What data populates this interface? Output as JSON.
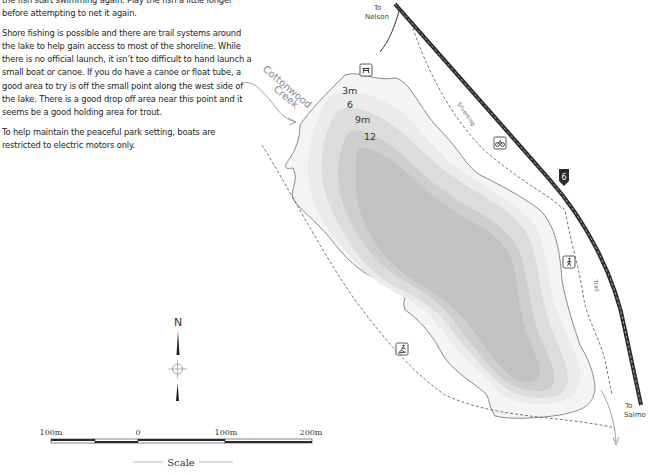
{
  "article": {
    "paragraphs": [
      "the fish start swimming again. Play the fish a little longer before attempting to net it again.",
      "Shore fishing is possible and there are trail systems around the lake to help gain access to most of the shoreline. While there is no official launch, it isn’t too difficult to hand launch a small boat or canoe. If you do have a canoe or float tube, a good area to try is off the small point along the west side of the lake. There is a good drop off area near this point and it seems be a good holding area for trout.",
      "To help maintain the peaceful park setting, boats are restricted to electric motors only."
    ]
  },
  "map": {
    "labels": {
      "to_nelson_1": "To",
      "to_nelson_2": "Nelson",
      "to_salmo_1": "To",
      "to_salmo_2": "Salmo",
      "creek_1": "Cottonwood",
      "creek_2": "Creek",
      "silverking": "Silverking",
      "trail": "Trail",
      "highway_number": "6"
    },
    "depth_labels": [
      "3m",
      "6",
      "9m",
      "12"
    ],
    "icons": [
      "picnic-icon",
      "cycling-icon",
      "hiking-icon",
      "cross-country-ski-icon"
    ],
    "compass": {
      "north_label": "N"
    },
    "scale": {
      "ticks": [
        "100m",
        "0",
        "100m",
        "200m"
      ],
      "title": "Scale"
    },
    "colors": {
      "shore": "#8a8a8a",
      "depth_3": "#ececec",
      "depth_6": "#dedede",
      "depth_9": "#cfcfcf",
      "depth_12": "#c2c2c2",
      "highway": "#2b2b2b",
      "trail": "#555555"
    }
  }
}
